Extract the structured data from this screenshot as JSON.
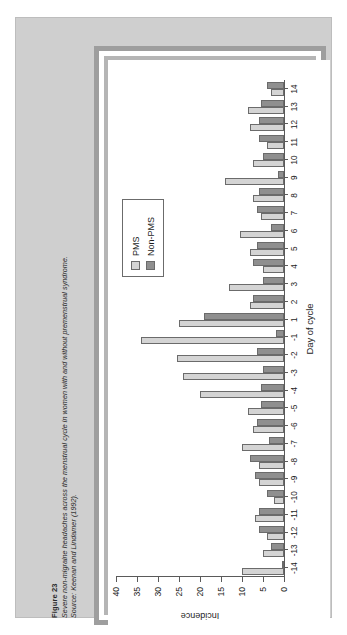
{
  "figure": {
    "label": "Figure 23",
    "description": "Severe non-migraine headaches across the menstrual cycle in women with and without premenstrual syndrome.",
    "source": "Source: Keenan and Lindamer (1992)."
  },
  "legend": {
    "position": "upper-right",
    "entries": [
      {
        "name": "PMS",
        "color": "#d4d4d4"
      },
      {
        "name": "Non-PMS",
        "color": "#8f8f8f"
      }
    ]
  },
  "colors": {
    "page_background": "#ffffff",
    "figure_panel": "#cfcfcf",
    "plate_border_outer": "#9e9e9e",
    "plate_border_inner": "#b5b5b5",
    "plot_background": "#ffffff",
    "series_pms": "#d4d4d4",
    "series_non_pms": "#8f8f8f",
    "axis": "#5a5a5a",
    "text": "#1d1d1d"
  },
  "chart_data": {
    "type": "bar",
    "title": "",
    "xlabel": "Day of cycle",
    "ylabel": "Incidence",
    "ylim": [
      0,
      40
    ],
    "yticks": [
      0,
      5,
      10,
      15,
      20,
      25,
      30,
      35,
      40
    ],
    "grid": false,
    "orientation": "vertical-bars-rotated-90ccw",
    "categories": [
      "-14",
      "-13",
      "-12",
      "-11",
      "-10",
      "-9",
      "-8",
      "-7",
      "-6",
      "-5",
      "-4",
      "-3",
      "-2",
      "-1",
      "1",
      "2",
      "3",
      "4",
      "5",
      "6",
      "7",
      "8",
      "9",
      "10",
      "11",
      "12",
      "13",
      "14"
    ],
    "series": [
      {
        "name": "PMS",
        "color": "#d4d4d4",
        "values": [
          10,
          5,
          4,
          7,
          2.5,
          6,
          6,
          10,
          7.5,
          8.5,
          20,
          24,
          25.5,
          34,
          25,
          8,
          13,
          5,
          8,
          10.5,
          5.5,
          7.5,
          14,
          7.5,
          4,
          8,
          8.5,
          3
        ]
      },
      {
        "name": "Non-PMS",
        "color": "#8f8f8f",
        "values": [
          0,
          3,
          6,
          6,
          4,
          7,
          8,
          3.5,
          6.5,
          5.5,
          5.5,
          5,
          6.5,
          2,
          19,
          7.5,
          5,
          7.5,
          6.5,
          3,
          6.5,
          6,
          1.5,
          5,
          6,
          6,
          5.5,
          4
        ]
      }
    ],
    "legend_entries": [
      "PMS",
      "Non-PMS"
    ]
  }
}
